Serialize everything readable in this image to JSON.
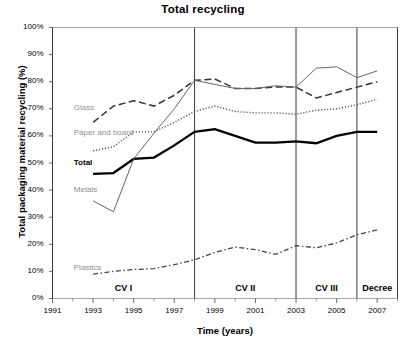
{
  "chart_data": {
    "type": "line",
    "title": "Total recycling",
    "xlabel": "Time (years)",
    "ylabel": "Total packaging material recycling (%)",
    "xlim": [
      1991,
      2008
    ],
    "ylim": [
      0,
      100
    ],
    "grid": false,
    "legend_position": "inline-left",
    "y_ticks": [
      "0%",
      "10%",
      "20%",
      "30%",
      "40%",
      "50%",
      "60%",
      "70%",
      "80%",
      "90%",
      "100%"
    ],
    "y_tick_values": [
      0,
      10,
      20,
      30,
      40,
      50,
      60,
      70,
      80,
      90,
      100
    ],
    "x_ticks": [
      "1991",
      "1993",
      "1995",
      "1997",
      "1999",
      "2001",
      "2003",
      "2005",
      "2007"
    ],
    "x_tick_values": [
      1991,
      1993,
      1995,
      1997,
      1999,
      2001,
      2003,
      2005,
      2007
    ],
    "x_minor_ticks": [
      1992,
      1994,
      1996,
      1998,
      2000,
      2002,
      2004,
      2006,
      2008
    ],
    "series": [
      {
        "name": "Glass",
        "style": "dashed",
        "color": "#333333",
        "x": [
          1993,
          1994,
          1995,
          1996,
          1997,
          1998,
          1999,
          2000,
          2001,
          2002,
          2003,
          2004,
          2005,
          2006,
          2007
        ],
        "values": [
          65,
          71,
          73,
          71,
          75,
          80.5,
          81,
          77.5,
          77.5,
          78,
          78,
          74,
          76,
          78,
          80
        ]
      },
      {
        "name": "Paper and board",
        "style": "dotted",
        "color": "#555555",
        "x": [
          1993,
          1994,
          1995,
          1996,
          1997,
          1998,
          1999,
          2000,
          2001,
          2002,
          2003,
          2004,
          2005,
          2006,
          2007
        ],
        "values": [
          54.5,
          56,
          61.5,
          61.5,
          65,
          69,
          71,
          69,
          68.5,
          68.5,
          68,
          69.5,
          70,
          71.5,
          73.5
        ]
      },
      {
        "name": "Total",
        "style": "solid-bold",
        "color": "#000000",
        "x": [
          1993,
          1994,
          1995,
          1996,
          1997,
          1998,
          1999,
          2000,
          2001,
          2002,
          2003,
          2004,
          2005,
          2006,
          2007
        ],
        "values": [
          46,
          46.3,
          51.5,
          52,
          56.5,
          61.5,
          62.5,
          60,
          57.5,
          57.5,
          58,
          57.3,
          60,
          61.5,
          61.5
        ]
      },
      {
        "name": "Metals",
        "style": "solid-thin",
        "color": "#666666",
        "x": [
          1993,
          1994,
          1995,
          1996,
          1997,
          1998,
          1999,
          2000,
          2001,
          2002,
          2003,
          2004,
          2005,
          2006,
          2007
        ],
        "values": [
          36,
          32,
          51.5,
          61,
          70,
          80.5,
          79,
          77.5,
          77.5,
          78.5,
          78,
          85,
          85.5,
          81.5,
          84
        ]
      },
      {
        "name": "Plastics",
        "style": "dashdot",
        "color": "#444444",
        "x": [
          1993,
          1994,
          1995,
          1996,
          1997,
          1998,
          1999,
          2000,
          2001,
          2002,
          2003,
          2004,
          2005,
          2006,
          2007
        ],
        "values": [
          9,
          10,
          10.7,
          11,
          12.5,
          14.3,
          17,
          19,
          18,
          16.3,
          19.5,
          18.7,
          20.5,
          23.5,
          25.3
        ]
      }
    ],
    "phases": [
      {
        "label": "CV I",
        "start": 1991,
        "end": 1998
      },
      {
        "label": "CV II",
        "start": 1998,
        "end": 2003
      },
      {
        "label": "CV III",
        "start": 2003,
        "end": 2006
      },
      {
        "label": "Decree",
        "start": 2006,
        "end": 2008
      }
    ],
    "phase_boundaries": [
      1991,
      1998,
      2003,
      2006,
      2008
    ],
    "series_inline_labels": [
      {
        "name": "Glass",
        "x": 1992.0,
        "y": 70.0
      },
      {
        "name": "Paper and board",
        "x": 1992.0,
        "y": 61.0
      },
      {
        "name": "Total",
        "x": 1992.0,
        "y": 50.0
      },
      {
        "name": "Metals",
        "x": 1992.0,
        "y": 40.0
      },
      {
        "name": "Plastics",
        "x": 1992.0,
        "y": 11.0
      }
    ]
  }
}
